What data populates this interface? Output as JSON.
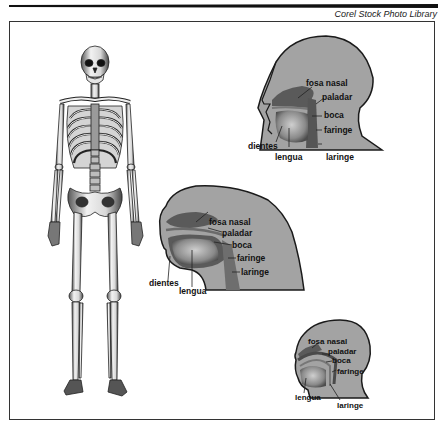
{
  "header": {
    "credit": "Corel Stock Photo Library"
  },
  "figure": {
    "skeleton": {
      "description": "Full human skeleton, front view"
    },
    "heads": [
      {
        "id": "human",
        "labels": {
          "nasal": "fosa nasal",
          "palate": "paladar",
          "mouth": "boca",
          "pharynx": "faringe",
          "teeth": "dientes",
          "tongue": "lengua",
          "larynx": "laringe"
        }
      },
      {
        "id": "ape",
        "labels": {
          "nasal": "fosa nasal",
          "palate": "paladar",
          "mouth": "boca",
          "pharynx": "faringe",
          "larynx": "laringe",
          "teeth": "dientes",
          "tongue": "lengua"
        }
      },
      {
        "id": "infant",
        "labels": {
          "nasal": "fosa nasal",
          "palate": "paladar",
          "mouth": "boca",
          "pharynx": "faringe",
          "tongue": "lengua",
          "larynx": "laringe"
        }
      }
    ]
  },
  "colors": {
    "head_fill": "#a3a3a3",
    "cavity_dark": "#5a5a5a",
    "tongue": "#8c8c8c",
    "outline": "#1a1a1a"
  }
}
